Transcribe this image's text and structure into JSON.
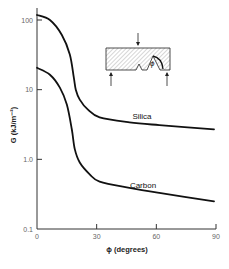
{
  "chart_data": {
    "type": "line",
    "title": "",
    "xlabel": "ϕ  (degrees)",
    "ylabel": "G  (kJ/m⁻²)",
    "xlim": [
      0,
      90
    ],
    "ylim": [
      0.1,
      100
    ],
    "yscale": "log",
    "xticks": [
      0,
      30,
      60,
      90
    ],
    "xtick_labels": [
      "0",
      "30",
      "60",
      "90"
    ],
    "yticks": [
      0.1,
      1.0,
      10,
      100
    ],
    "ytick_labels": [
      "0.1",
      "1.0",
      "10",
      "100"
    ],
    "grid": false,
    "legend": "none (inline labels)",
    "series": [
      {
        "name": "Silica",
        "x": [
          0,
          6.5,
          12.5,
          16.5,
          18.5,
          19.5,
          21.5,
          25.5,
          31.5,
          46.5,
          61.5,
          89
        ],
        "y": [
          118,
          100,
          61,
          32,
          15,
          10,
          7.2,
          5.2,
          4.0,
          3.4,
          3.1,
          2.7
        ]
      },
      {
        "name": "Carbon",
        "x": [
          0,
          6.5,
          11.5,
          15,
          17.5,
          19,
          21.5,
          26.5,
          31.5,
          46.5,
          61.5,
          89
        ],
        "y": [
          20.6,
          16.4,
          10.7,
          6.1,
          2.7,
          1.4,
          0.9,
          0.61,
          0.48,
          0.39,
          0.33,
          0.25
        ]
      }
    ],
    "annotations": [
      "Silica",
      "Carbon",
      "inset: notched specimen loading diagram with angle ϕ"
    ]
  }
}
